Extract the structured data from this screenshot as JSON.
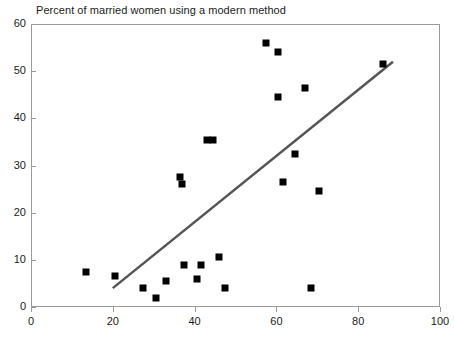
{
  "chart_data": {
    "type": "scatter",
    "title": "Percent of married women using a modern method",
    "xlabel": "",
    "ylabel": "",
    "xlim": [
      0,
      100
    ],
    "ylim": [
      0,
      60
    ],
    "xticks": [
      0,
      20,
      40,
      60,
      80,
      100
    ],
    "yticks": [
      0,
      10,
      20,
      30,
      40,
      50,
      60
    ],
    "grid": false,
    "legend": null,
    "marker": "square",
    "marker_color": "#000000",
    "points": [
      {
        "x": 13.5,
        "y": 7.5
      },
      {
        "x": 20.5,
        "y": 6.5
      },
      {
        "x": 27.5,
        "y": 4.0
      },
      {
        "x": 30.5,
        "y": 2.0
      },
      {
        "x": 33.0,
        "y": 5.5
      },
      {
        "x": 36.5,
        "y": 27.5
      },
      {
        "x": 37.0,
        "y": 26.0
      },
      {
        "x": 37.5,
        "y": 9.0
      },
      {
        "x": 40.5,
        "y": 6.0
      },
      {
        "x": 41.5,
        "y": 9.0
      },
      {
        "x": 43.0,
        "y": 35.5
      },
      {
        "x": 44.5,
        "y": 35.5
      },
      {
        "x": 46.0,
        "y": 10.5
      },
      {
        "x": 47.5,
        "y": 4.0
      },
      {
        "x": 57.5,
        "y": 56.0
      },
      {
        "x": 60.5,
        "y": 54.0
      },
      {
        "x": 60.5,
        "y": 44.5
      },
      {
        "x": 61.5,
        "y": 26.5
      },
      {
        "x": 64.5,
        "y": 32.5
      },
      {
        "x": 67.0,
        "y": 46.5
      },
      {
        "x": 68.5,
        "y": 4.0
      },
      {
        "x": 70.5,
        "y": 24.5
      },
      {
        "x": 86.0,
        "y": 51.5
      }
    ],
    "trendline": {
      "color": "#555555",
      "width": 2.5,
      "x0": 20.0,
      "y0": 4.0,
      "x1": 88.5,
      "y1": 52.0
    }
  },
  "axes": {
    "y_tick_labels": [
      "60",
      "50",
      "40",
      "30",
      "20",
      "10",
      "0"
    ],
    "x_tick_labels": [
      "0",
      "20",
      "40",
      "60",
      "80",
      "100"
    ]
  }
}
